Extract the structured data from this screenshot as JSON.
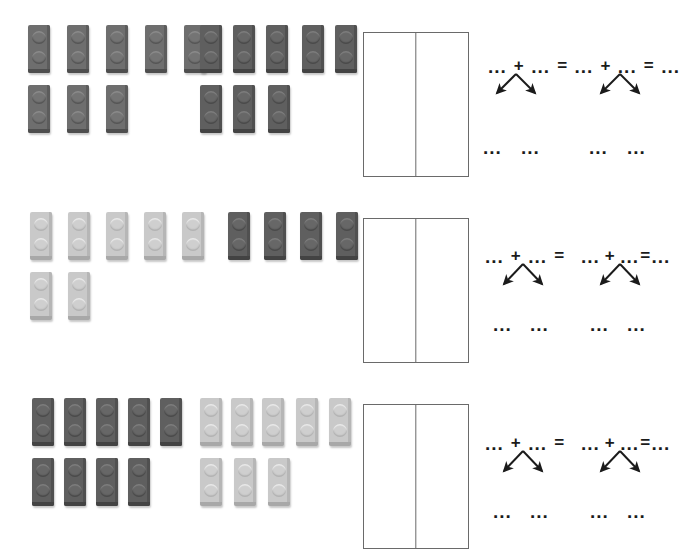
{
  "page": {
    "width": 689,
    "height": 553,
    "background": "#ffffff"
  },
  "tokens": {
    "dots": "...",
    "plus": "+",
    "equals": "=",
    "blank_dots": "..."
  },
  "colors": {
    "brick_dark": "#6e6e6e",
    "brick_darker": "#5f5f5f",
    "brick_light": "#c9c9c9",
    "ink": "#1b1b1b",
    "box_border": "#6a6a6a",
    "paper": "#ffffff"
  },
  "problems": [
    {
      "id": "problem-1",
      "top": 25,
      "brick_groups": [
        {
          "name": "group-left",
          "color": "dark",
          "left": 28,
          "rows": [
            {
              "count": 5,
              "top": 0,
              "left": 0,
              "spacing": 39
            },
            {
              "count": 3,
              "top": 60,
              "left": 0,
              "spacing": 39
            }
          ],
          "total": 8
        },
        {
          "name": "group-right",
          "color": "darker",
          "left": 200,
          "rows": [
            {
              "count": 5,
              "top": 0,
              "left": 0,
              "spacing": 38
            },
            {
              "count": 3,
              "top": 60,
              "left": 0,
              "spacing": 38
            }
          ],
          "total": 8
        }
      ],
      "box": {
        "left": 363,
        "top": 32,
        "width": 106,
        "height": 145
      },
      "equation": {
        "left": 488,
        "top": 62,
        "line_segments": [
          {
            "text": "...",
            "type": "blank"
          },
          {
            "text": "+",
            "type": "operator"
          },
          {
            "text": "...",
            "type": "blank"
          },
          {
            "text": "=",
            "type": "operator"
          },
          {
            "text": "...",
            "type": "blank"
          },
          {
            "text": "+",
            "type": "operator"
          },
          {
            "text": "...",
            "type": "blank"
          },
          {
            "text": "=",
            "type": "operator"
          },
          {
            "text": "...",
            "type": "blank"
          }
        ],
        "line_text": "... + ... = ... + ... = ...",
        "branches": [
          {
            "name": "branch-left",
            "apex_x": 516,
            "left_leaf": "...",
            "right_leaf": "...",
            "leaf_left_x": 496,
            "leaf_right_x": 534
          },
          {
            "name": "branch-right",
            "apex_x": 620,
            "left_leaf": "...",
            "right_leaf": "...",
            "leaf_left_x": 597,
            "leaf_right_x": 635
          }
        ],
        "bottom_dots_top": 140
      }
    },
    {
      "id": "problem-2",
      "top": 212,
      "brick_groups": [
        {
          "name": "group-left",
          "color": "light",
          "left": 30,
          "rows": [
            {
              "count": 5,
              "top": 0,
              "left": 0,
              "spacing": 39
            },
            {
              "count": 2,
              "top": 60,
              "left": 0,
              "spacing": 39
            }
          ],
          "total": 7
        },
        {
          "name": "group-right",
          "color": "darker",
          "left": 228,
          "rows": [
            {
              "count": 4,
              "top": 0,
              "left": 0,
              "spacing": 34
            }
          ],
          "total": 4
        }
      ],
      "box": {
        "left": 363,
        "top": 218,
        "width": 106,
        "height": 145
      },
      "equation": {
        "left": 485,
        "top": 245,
        "line_segments": [
          {
            "text": "...",
            "type": "blank"
          },
          {
            "text": "+",
            "type": "operator"
          },
          {
            "text": "...",
            "type": "blank"
          },
          {
            "text": "=",
            "type": "operator"
          },
          {
            "text": "...",
            "type": "blank"
          },
          {
            "text": "+",
            "type": "operator"
          },
          {
            "text": "...",
            "type": "blank"
          },
          {
            "text": "=",
            "type": "operator"
          },
          {
            "text": "...",
            "type": "blank"
          }
        ],
        "line_text": "... + ... =     ... + ... = ...",
        "branches": [
          {
            "name": "branch-left",
            "apex_x": 523,
            "left_leaf": "...",
            "right_leaf": "...",
            "leaf_left_x": 498,
            "leaf_right_x": 534
          },
          {
            "name": "branch-right",
            "apex_x": 620,
            "left_leaf": "...",
            "right_leaf": "...",
            "leaf_left_x": 595,
            "leaf_right_x": 631
          }
        ],
        "bottom_dots_top": 70
      }
    },
    {
      "id": "problem-3",
      "top": 398,
      "brick_groups": [
        {
          "name": "group-left",
          "color": "darker",
          "left": 32,
          "rows": [
            {
              "count": 5,
              "top": 0,
              "left": 0,
              "spacing": 33
            },
            {
              "count": 4,
              "top": 60,
              "left": 0,
              "spacing": 33
            }
          ],
          "total": 9
        },
        {
          "name": "group-right",
          "color": "light",
          "left": 200,
          "rows": [
            {
              "count": 5,
              "top": 0,
              "left": 0,
              "spacing": 33
            },
            {
              "count": 3,
              "top": 60,
              "left": 0,
              "spacing": 33
            }
          ],
          "total": 8
        }
      ],
      "box": {
        "left": 363,
        "top": 404,
        "width": 106,
        "height": 145
      },
      "equation": {
        "left": 485,
        "top": 432,
        "line_segments": [
          {
            "text": "...",
            "type": "blank"
          },
          {
            "text": "+",
            "type": "operator"
          },
          {
            "text": "...",
            "type": "blank"
          },
          {
            "text": "=",
            "type": "operator"
          },
          {
            "text": "...",
            "type": "blank"
          },
          {
            "text": "+",
            "type": "operator"
          },
          {
            "text": "...",
            "type": "blank"
          },
          {
            "text": "=",
            "type": "operator"
          },
          {
            "text": "...",
            "type": "blank"
          }
        ],
        "line_text": "... + ... =     ... + ... = ...",
        "branches": [
          {
            "name": "branch-left",
            "apex_x": 523,
            "left_leaf": "...",
            "right_leaf": "...",
            "leaf_left_x": 498,
            "leaf_right_x": 534
          },
          {
            "name": "branch-right",
            "apex_x": 620,
            "left_leaf": "...",
            "right_leaf": "...",
            "leaf_left_x": 595,
            "leaf_right_x": 631
          }
        ],
        "bottom_dots_top": 70
      }
    }
  ]
}
